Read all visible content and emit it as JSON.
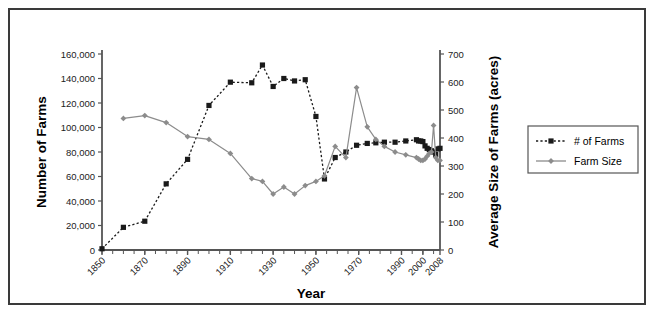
{
  "chart_data": {
    "type": "line",
    "title": "",
    "xlabel": "Year",
    "ylabel": "Number of Farms",
    "y2label": "Average Size of Farms (acres)",
    "grid": false,
    "legend_position": "right",
    "xlim": [
      1850,
      2008
    ],
    "ylim": [
      0,
      160000
    ],
    "y2lim": [
      0,
      700
    ],
    "xticks": [
      "1850",
      "1870",
      "1890",
      "1910",
      "1930",
      "1950",
      "1970",
      "1990",
      "2000",
      "2008"
    ],
    "xtick_values": [
      1850,
      1870,
      1890,
      1910,
      1930,
      1950,
      1970,
      1990,
      2000,
      2008
    ],
    "yticks": [
      "0",
      "20,000",
      "40,000",
      "60,000",
      "80,000",
      "100,000",
      "120,000",
      "140,000",
      "160,000"
    ],
    "ytick_values": [
      0,
      20000,
      40000,
      60000,
      80000,
      100000,
      120000,
      140000,
      160000
    ],
    "y2ticks": [
      "0",
      "100",
      "200",
      "300",
      "400",
      "500",
      "600",
      "700"
    ],
    "y2tick_values": [
      0,
      100,
      200,
      300,
      400,
      500,
      600,
      700
    ],
    "series": [
      {
        "name": "# of Farms",
        "axis": "left",
        "color": "#1a1a1a",
        "marker": "square",
        "line_style": "dotted",
        "x": [
          1850,
          1860,
          1870,
          1880,
          1890,
          1900,
          1910,
          1920,
          1925,
          1930,
          1935,
          1940,
          1945,
          1950,
          1954,
          1959,
          1964,
          1969,
          1974,
          1978,
          1982,
          1987,
          1992,
          1997,
          1998,
          1999,
          2000,
          2001,
          2002,
          2003,
          2004,
          2005,
          2006,
          2007,
          2008
        ],
        "values": [
          1000,
          18500,
          23500,
          54000,
          74000,
          118000,
          137000,
          136500,
          151000,
          133500,
          140000,
          138000,
          139000,
          109000,
          58000,
          75500,
          80000,
          85500,
          87000,
          87500,
          88000,
          88000,
          89000,
          90000,
          89000,
          89000,
          88500,
          85000,
          83000,
          82000,
          81000,
          80000,
          78000,
          82500,
          83000
        ]
      },
      {
        "name": "Farm Size",
        "axis": "right",
        "color": "#8c8c8c",
        "marker": "diamond",
        "line_style": "solid",
        "x": [
          1860,
          1870,
          1880,
          1890,
          1900,
          1910,
          1920,
          1925,
          1930,
          1935,
          1940,
          1945,
          1950,
          1954,
          1959,
          1964,
          1969,
          1974,
          1978,
          1982,
          1987,
          1992,
          1997,
          1998,
          1999,
          2000,
          2001,
          2002,
          2003,
          2004,
          2005,
          2006,
          2007,
          2008
        ],
        "values": [
          470,
          480,
          455,
          405,
          395,
          345,
          255,
          245,
          200,
          225,
          200,
          230,
          245,
          265,
          370,
          330,
          580,
          440,
          395,
          370,
          350,
          340,
          330,
          325,
          320,
          320,
          325,
          335,
          345,
          350,
          445,
          330,
          320,
          320
        ]
      }
    ]
  },
  "legend": {
    "items": [
      {
        "label": "# of Farms"
      },
      {
        "label": "Farm Size"
      }
    ]
  },
  "colors": {
    "farms_series": "#1a1a1a",
    "size_series": "#8c8c8c",
    "axis": "#555555",
    "frame": "#3a3a3a"
  }
}
